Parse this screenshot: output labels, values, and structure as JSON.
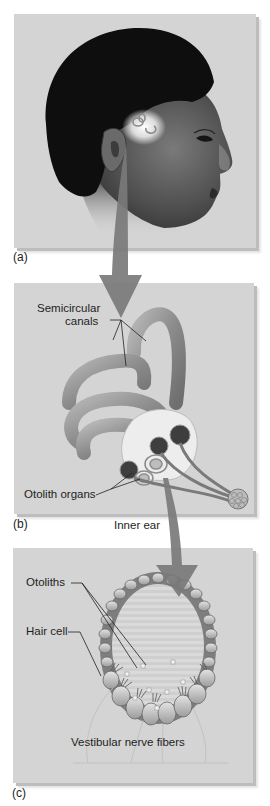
{
  "figure": {
    "panels": [
      {
        "id": "a",
        "letter": "(a)",
        "subject": "Human head in profile with inner ear highlighted"
      },
      {
        "id": "b",
        "letter": "(b)",
        "subject": "Inner ear"
      },
      {
        "id": "c",
        "letter": "(c)",
        "subject": "Otolith organ cross-section"
      }
    ],
    "panel_b": {
      "labels": {
        "semicircular_canals_line1": "Semicircular",
        "semicircular_canals_line2": "canals",
        "otolith_organs": "Otolith organs",
        "inner_ear": "Inner ear"
      }
    },
    "panel_c": {
      "labels": {
        "otoliths": "Otoliths",
        "hair_cell": "Hair cell",
        "vestibular_nerve_fibers": "Vestibular nerve fibers"
      }
    },
    "colors": {
      "panel_bg": "#d4d4d4",
      "arrow": "#7a7a7a",
      "hair": "#0e0e0e",
      "skin": "#5a5a5a",
      "canal": "#9a9a9a"
    }
  }
}
